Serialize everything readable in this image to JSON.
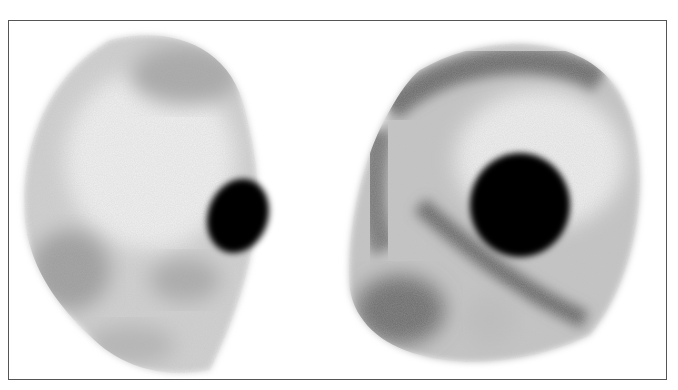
{
  "figure": {
    "type": "bone-scintigraphy",
    "panels": [
      {
        "id": "left",
        "view": "lateral skull",
        "hotspot": "dark oval focal uptake, right side of skull"
      },
      {
        "id": "right",
        "view": "oblique skull",
        "hotspot": "large round dark focal uptake, center-right"
      }
    ],
    "colors": {
      "background": "#ffffff",
      "frame": "#555555",
      "uptake": "#000000"
    }
  }
}
